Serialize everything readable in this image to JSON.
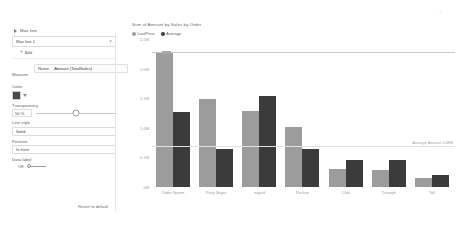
{
  "panel": {
    "header_title": "Max line",
    "collapse_icon": "chevron-right-icon",
    "selected_line": "Max line 1",
    "remove_icon": "close-icon",
    "add_label": "Add",
    "add_icon": "plus-icon",
    "measure": {
      "caption": "Measure",
      "table": "Name",
      "field": "Amount (TotalSales)"
    },
    "color": {
      "caption": "Color",
      "swatch_hex": "#4b4b4b",
      "caret_icon": "chevron-down-icon"
    },
    "transparency": {
      "caption": "Transparency",
      "value": "50 %",
      "slider_percent": 50
    },
    "line_style": {
      "caption": "Line style",
      "value": "Solid"
    },
    "position": {
      "caption": "Position",
      "value": "In front"
    },
    "data_label": {
      "caption": "Data label",
      "state": "Off"
    },
    "revert_label": "Revert to default"
  },
  "chart_data": {
    "type": "bar",
    "title": "Sum of Amount by Sales by Order",
    "xlabel": "",
    "ylabel": "",
    "ylim": [
      0,
      2500000
    ],
    "grid": false,
    "legend_position": "top-left",
    "categories": [
      "Order Sperm",
      "Party Buyer",
      "regard",
      "Re-hire",
      "Club",
      "Triumph",
      "Toll"
    ],
    "ytick_labels": [
      "0M",
      "0.5M",
      "1.0M",
      "1.5M",
      "2.0M",
      "2.5M"
    ],
    "ytick_values": [
      0,
      500000,
      1000000,
      1500000,
      2000000,
      2500000
    ],
    "series": [
      {
        "name": "LastPrice",
        "color": "#9c9c9c",
        "values": [
          2260000,
          1490000,
          1290000,
          1020000,
          310000,
          290000,
          160000
        ]
      },
      {
        "name": "Average",
        "color": "#3b3b3b",
        "values": [
          1270000,
          640000,
          1540000,
          640000,
          460000,
          460000,
          210000
        ]
      }
    ],
    "reference_lines": [
      {
        "name": "Max line 1",
        "kind": "max",
        "value": 2260000,
        "label": "",
        "color": "#c9c9c9"
      },
      {
        "name": "Average line",
        "kind": "average",
        "value": 680000,
        "label": "Average Amount 0.68M",
        "color": "#e2e2e2"
      }
    ]
  }
}
